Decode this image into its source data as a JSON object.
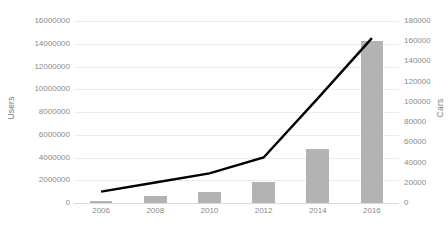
{
  "chart_data": {
    "type": "bar",
    "title": "",
    "subtitle": "",
    "xlabel": "",
    "categories": [
      "2006",
      "2008",
      "2010",
      "2012",
      "2014",
      "2016"
    ],
    "x_values": [
      2006,
      2008,
      2010,
      2012,
      2014,
      2016
    ],
    "grid": true,
    "legend": "none",
    "series": [
      {
        "name": "Cars",
        "chart_type": "bar",
        "axis": "right",
        "color": "#b3b3b3",
        "values": [
          2500,
          7000,
          11000,
          20500,
          53000,
          160000
        ]
      },
      {
        "name": "Users",
        "chart_type": "line",
        "axis": "left",
        "color": "#000000",
        "values": [
          1000000,
          1800000,
          2600000,
          4000000,
          9200000,
          14500000
        ]
      }
    ],
    "axes": {
      "left": {
        "label": "Users",
        "min": 0,
        "max": 16000000,
        "step": 2000000,
        "ticks": [
          "0",
          "2000000",
          "4000000",
          "6000000",
          "8000000",
          "10000000",
          "12000000",
          "14000000",
          "16000000"
        ],
        "tick_values": [
          0,
          2000000,
          4000000,
          6000000,
          8000000,
          10000000,
          12000000,
          14000000,
          16000000
        ]
      },
      "right": {
        "label": "Cars",
        "min": 0,
        "max": 180000,
        "step": 20000,
        "ticks": [
          "0",
          "20000",
          "40000",
          "60000",
          "80000",
          "100000",
          "120000",
          "140000",
          "160000",
          "180000"
        ],
        "tick_values": [
          0,
          20000,
          40000,
          60000,
          80000,
          100000,
          120000,
          140000,
          160000,
          180000
        ]
      }
    },
    "colors": {
      "bar": "#b3b3b3",
      "line": "#000000",
      "grid": "#ececec",
      "text": "#8a8a8a"
    }
  }
}
